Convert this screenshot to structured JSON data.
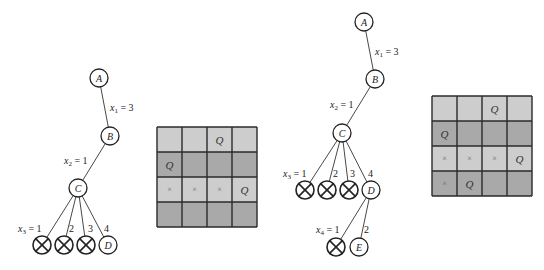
{
  "colors": {
    "light_cell": "#cdcdcd",
    "dark_cell": "#a9a9a9",
    "grid_line": "#2a2a2a"
  },
  "tree_left": {
    "nodes": [
      {
        "id": "A",
        "label": "A",
        "x": 99,
        "y": 78
      },
      {
        "id": "B",
        "label": "B",
        "x": 110,
        "y": 136
      },
      {
        "id": "C",
        "label": "C",
        "x": 78,
        "y": 188
      },
      {
        "id": "X1",
        "label": "",
        "pruned": true,
        "x": 42,
        "y": 245
      },
      {
        "id": "X2",
        "label": "",
        "pruned": true,
        "x": 64,
        "y": 245
      },
      {
        "id": "X3",
        "label": "",
        "pruned": true,
        "x": 86,
        "y": 245
      },
      {
        "id": "D",
        "label": "D",
        "x": 108,
        "y": 245
      }
    ],
    "edges": [
      [
        "A",
        "B"
      ],
      [
        "B",
        "C"
      ],
      [
        "C",
        "X1"
      ],
      [
        "C",
        "X2"
      ],
      [
        "C",
        "X3"
      ],
      [
        "C",
        "D"
      ]
    ],
    "labels": [
      {
        "text": "x",
        "sub": "1",
        "rest": " = 3",
        "x": 110,
        "y": 111
      },
      {
        "text": "x",
        "sub": "2",
        "rest": " = 1",
        "x": 64,
        "y": 164
      },
      {
        "text": "x",
        "sub": "3",
        "rest": " = 1",
        "x": 18,
        "y": 232
      },
      {
        "text": "2",
        "x": 69,
        "y": 232
      },
      {
        "text": "3",
        "x": 88,
        "y": 232
      },
      {
        "text": "4",
        "x": 104,
        "y": 232
      }
    ]
  },
  "grid_left": {
    "x": 157,
    "y": 127,
    "size": 100,
    "rows": [
      {
        "shade": "light",
        "cells": [
          "",
          "",
          "Q",
          ""
        ]
      },
      {
        "shade": "dark",
        "cells": [
          "Q",
          "",
          "",
          ""
        ]
      },
      {
        "shade": "light",
        "cells": [
          "×",
          "×",
          "×",
          "Q"
        ]
      },
      {
        "shade": "dark",
        "cells": [
          "",
          "",
          "",
          ""
        ]
      }
    ]
  },
  "tree_right": {
    "nodes": [
      {
        "id": "A",
        "label": "A",
        "x": 364,
        "y": 22
      },
      {
        "id": "B",
        "label": "B",
        "x": 375,
        "y": 79
      },
      {
        "id": "C",
        "label": "C",
        "x": 342,
        "y": 133
      },
      {
        "id": "X1",
        "label": "",
        "pruned": true,
        "x": 305,
        "y": 190
      },
      {
        "id": "X2",
        "label": "",
        "pruned": true,
        "x": 327,
        "y": 190
      },
      {
        "id": "X3",
        "label": "",
        "pruned": true,
        "x": 349,
        "y": 190
      },
      {
        "id": "D",
        "label": "D",
        "x": 371,
        "y": 190
      },
      {
        "id": "X4",
        "label": "",
        "pruned": true,
        "x": 336,
        "y": 247
      },
      {
        "id": "E",
        "label": "E",
        "x": 359,
        "y": 247
      }
    ],
    "edges": [
      [
        "A",
        "B"
      ],
      [
        "B",
        "C"
      ],
      [
        "C",
        "X1"
      ],
      [
        "C",
        "X2"
      ],
      [
        "C",
        "X3"
      ],
      [
        "C",
        "D"
      ],
      [
        "D",
        "X4"
      ],
      [
        "D",
        "E"
      ]
    ],
    "labels": [
      {
        "text": "x",
        "sub": "1",
        "rest": " = 3",
        "x": 375,
        "y": 55
      },
      {
        "text": "x",
        "sub": "2",
        "rest": " = 1",
        "x": 330,
        "y": 108
      },
      {
        "text": "x",
        "sub": "3",
        "rest": " = 1",
        "x": 283,
        "y": 177
      },
      {
        "text": "2",
        "x": 333,
        "y": 177
      },
      {
        "text": "3",
        "x": 350,
        "y": 177
      },
      {
        "text": "4",
        "x": 368,
        "y": 177
      },
      {
        "text": "x",
        "sub": "4",
        "rest": " = 1",
        "x": 316,
        "y": 233
      },
      {
        "text": "2",
        "x": 364,
        "y": 233
      }
    ]
  },
  "grid_right": {
    "x": 432,
    "y": 96,
    "size": 100,
    "rows": [
      {
        "shade": "light",
        "cells": [
          "",
          "",
          "Q",
          ""
        ]
      },
      {
        "shade": "dark",
        "cells": [
          "Q",
          "",
          "",
          ""
        ]
      },
      {
        "shade": "light",
        "cells": [
          "×",
          "×",
          "×",
          "Q"
        ]
      },
      {
        "shade": "dark",
        "cells": [
          "×",
          "Q",
          "",
          ""
        ]
      }
    ]
  }
}
